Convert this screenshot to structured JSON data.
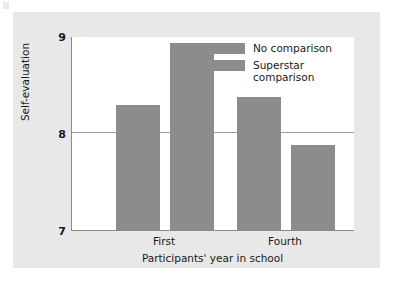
{
  "chart_data": {
    "type": "bar",
    "title": "",
    "xlabel": "Participants' year in school",
    "ylabel": "Self-evaluation",
    "categories": [
      "First",
      "Fourth"
    ],
    "series": [
      {
        "name": "No comparison",
        "values": [
          8.29,
          8.37
        ]
      },
      {
        "name": "Superstar comparison",
        "values": [
          8.93,
          7.88
        ]
      }
    ],
    "ylim": [
      7,
      9
    ],
    "yticks": [
      "7",
      "8",
      "9"
    ],
    "ytick_values": [
      7,
      8,
      9
    ],
    "grid": "horizontal gridline at y = 8 only",
    "legend_position": "inside top-right of plot area",
    "bar_color": "#8c8c8c",
    "panel_color": "#e8e8e8",
    "plot_background": "#ffffff"
  },
  "axes": {
    "y_title": "Self-evaluation",
    "x_title": "Participants' year in school",
    "y_tick_top": "9",
    "y_tick_mid": "8",
    "y_tick_bottom": "7",
    "x_tick_first": "First",
    "x_tick_second": "Fourth"
  },
  "legend": {
    "items": [
      {
        "label": "No comparison",
        "color": "#8c8c8c"
      },
      {
        "label": "Superstar\ncomparison",
        "color": "#8c8c8c"
      }
    ]
  }
}
